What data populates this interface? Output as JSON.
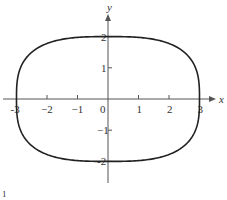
{
  "chart_data": {
    "type": "line",
    "title": "",
    "xlabel": "x",
    "ylabel": "y",
    "xlim": [
      -3.5,
      3.5
    ],
    "ylim": [
      -2.7,
      2.8
    ],
    "x_ticks": [
      -3,
      -2,
      -1,
      0,
      1,
      2,
      3
    ],
    "x_tick_labels": [
      "-3",
      "−2",
      "−1",
      "0",
      "1",
      "2",
      "3"
    ],
    "y_ticks": [
      -2,
      -1,
      1,
      2
    ],
    "y_tick_labels": [
      "-2",
      "−1",
      "1",
      "2"
    ],
    "origin_label": "0",
    "grid": false,
    "legend": "none",
    "series": [
      {
        "name": "closed curve",
        "description": "superellipse-like closed curve |x/3|^3 + |y/2|^3 = 1",
        "a": 3,
        "b": 2,
        "exponent": 3,
        "color": "#222222"
      }
    ],
    "annotations": [
      "1"
    ]
  },
  "colors": {
    "curve": "#222222",
    "axis": "#555555",
    "text": "#333333"
  }
}
